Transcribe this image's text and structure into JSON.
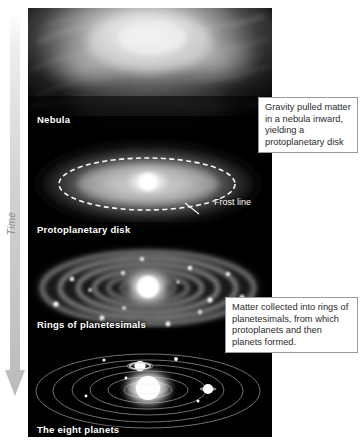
{
  "diagram": {
    "time_axis": {
      "label": "Time",
      "direction": "downward",
      "color": "#bdbdbd"
    }
  },
  "stages": [
    {
      "id": "nebula",
      "label": "Nebula"
    },
    {
      "id": "protoplanetary-disk",
      "label": "Protoplanetary disk"
    },
    {
      "id": "rings",
      "label": "Rings of planetesimals"
    },
    {
      "id": "planets",
      "label": "The eight planets"
    }
  ],
  "annotations": [
    {
      "id": "frost-line",
      "label": "Frost line"
    }
  ],
  "callouts": [
    {
      "id": "callout-gravity",
      "text": "Gravity pulled matter in a nebula inward, yielding a protoplanetary disk"
    },
    {
      "id": "callout-matter",
      "text": "Matter collected into rings of planetesimals, from which protoplanets and then planets formed."
    }
  ],
  "colors": {
    "background": "#ffffff",
    "panel": "#000000",
    "label_text": "#ffffff",
    "callout_border": "#9a9a9a",
    "callout_text": "#2b2b2b",
    "arrow": "#c8c8c8"
  }
}
